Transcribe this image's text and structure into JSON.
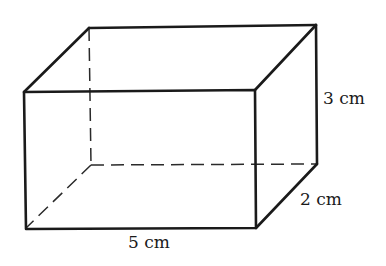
{
  "figure": {
    "type": "rectangular prism",
    "labels": {
      "length": "5 cm",
      "height": "3 cm",
      "depth": "2 cm"
    },
    "colors": {
      "line": "#1a1a1a",
      "background": "#ffffff"
    }
  }
}
